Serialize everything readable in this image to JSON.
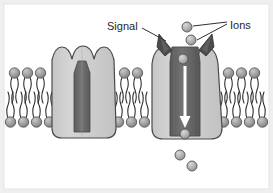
{
  "figure": {
    "background_color": "#ffffff",
    "frame_color": "#e8e8e8",
    "labels": [
      {
        "id": "signal",
        "text": "Signal",
        "x": 107,
        "y": 26
      },
      {
        "id": "ions",
        "text": "Ions",
        "x": 231,
        "y": 25
      }
    ],
    "palette": {
      "membrane_head": "#9a9a9a",
      "membrane_head_highlight": "#c9c9c9",
      "membrane_tail": "#2b2b2b",
      "protein_body": "#cfcfcf",
      "protein_body_shade": "#bcbcbc",
      "protein_outline": "#4a4a4a",
      "pore_closed": "#6e6e6e",
      "pore_open": "#6b6b6b",
      "pore_open_shade": "#5c5c5c",
      "signal_molecule": "#4c4c4c",
      "ion_fill": "#b4b4b4",
      "ion_outline": "#555555",
      "arrow_color": "#ffffff",
      "leader_line": "#303030",
      "text_color": "#262626"
    },
    "membrane": {
      "description": "phospholipid bilayer",
      "outer_leaflet_y": 73,
      "inner_leaflet_y": 122,
      "segments": [
        {
          "id": "left",
          "outer_head_count": 3,
          "inner_head_count": 4
        },
        {
          "id": "middle",
          "outer_head_count": 2,
          "inner_head_count": 4
        },
        {
          "id": "right",
          "outer_head_count": 3,
          "inner_head_count": 4
        }
      ]
    },
    "channels": [
      {
        "id": "closed-channel",
        "state": "closed",
        "center_x": 83,
        "pore_width_top": 16,
        "pore_width_bottom": 10,
        "signal_bound": false,
        "ions_passing": 0
      },
      {
        "id": "open-channel",
        "state": "open",
        "center_x": 185,
        "pore_width_top": 30,
        "pore_width_bottom": 24,
        "signal_bound": true,
        "ions_passing": 5
      }
    ],
    "signal_molecules": [
      {
        "id": "signal-left",
        "x": 165,
        "y": 42
      },
      {
        "id": "signal-right",
        "x": 209,
        "y": 42
      }
    ],
    "ions": [
      {
        "id": "ion-external-1",
        "x": 187,
        "y": 27,
        "r": 5.0
      },
      {
        "id": "ion-external-2",
        "x": 191,
        "y": 40,
        "r": 5.0
      },
      {
        "id": "ion-pore-1",
        "x": 183,
        "y": 59,
        "r": 5.0
      },
      {
        "id": "ion-pore-2",
        "x": 185,
        "y": 134,
        "r": 5.0
      },
      {
        "id": "ion-cytosol-1",
        "x": 180,
        "y": 155,
        "r": 5.0
      },
      {
        "id": "ion-cytosol-2",
        "x": 192,
        "y": 166,
        "r": 5.0
      }
    ],
    "flow_arrow": {
      "id": "ion-flow-arrow",
      "direction": "down",
      "x": 185,
      "y_start": 66,
      "y_end": 126
    },
    "leader_lines": [
      {
        "id": "signal-leader",
        "from_x": 142,
        "from_y": 28,
        "to_x": 166,
        "to_y": 40
      },
      {
        "id": "ions-leader-top",
        "from_x": 227,
        "from_y": 23,
        "to_x": 193,
        "to_y": 27
      },
      {
        "id": "ions-leader-bottom",
        "from_x": 227,
        "from_y": 26,
        "to_x": 196,
        "to_y": 40
      }
    ]
  }
}
